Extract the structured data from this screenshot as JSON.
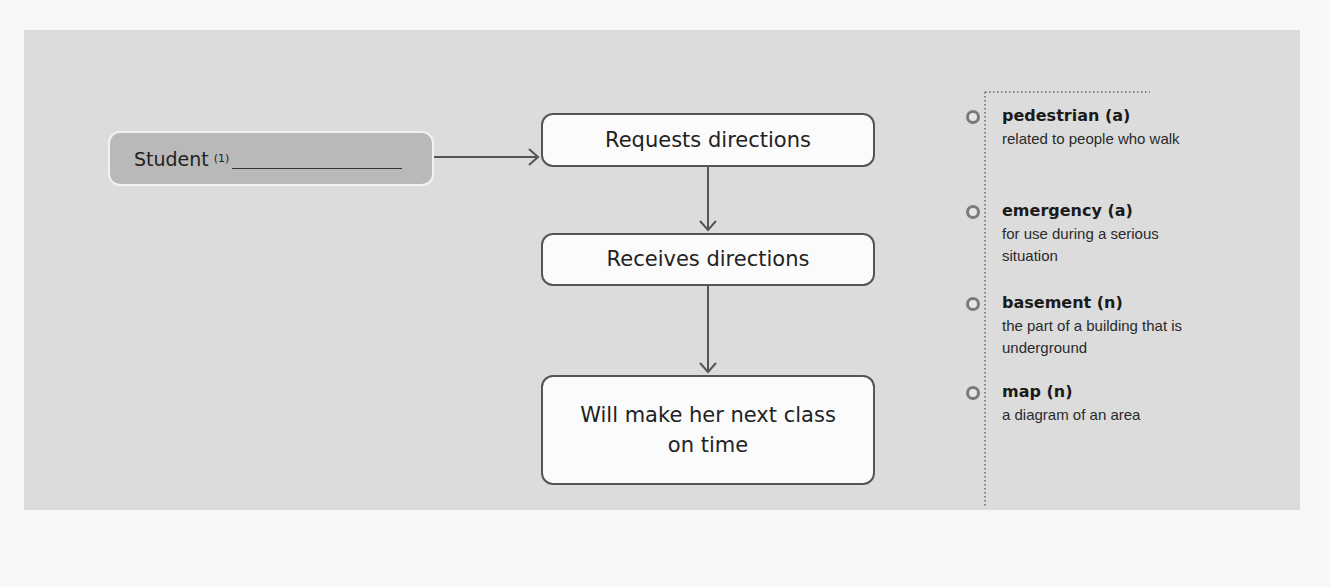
{
  "diagram": {
    "start_node": {
      "label": "Student",
      "footnote": "(1)",
      "blank": ""
    },
    "flow_nodes": [
      {
        "label": "Requests directions"
      },
      {
        "label": "Receives directions"
      },
      {
        "label": "Will make her next class on time"
      }
    ],
    "edges": [
      {
        "from": "Student",
        "to": "Requests directions",
        "direction": "right"
      },
      {
        "from": "Requests directions",
        "to": "Receives directions",
        "direction": "down"
      },
      {
        "from": "Receives directions",
        "to": "Will make her next class on time",
        "direction": "down"
      }
    ],
    "colors": {
      "panel": "#dcdcdc",
      "start_fill": "#b9b9b9",
      "box_fill": "#fbfbfb",
      "border": "#555555",
      "bullet": "#7a7a7a"
    }
  },
  "glossary": {
    "items": [
      {
        "term": "pedestrian (a)",
        "definition": "related to people who walk"
      },
      {
        "term": "emergency (a)",
        "definition": "for use during a serious situation"
      },
      {
        "term": "basement (n)",
        "definition": "the part of a building that is underground"
      },
      {
        "term": "map (n)",
        "definition": "a diagram of an area"
      }
    ]
  }
}
